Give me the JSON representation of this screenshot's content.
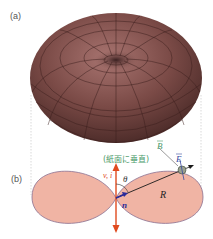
{
  "panels": {
    "a": {
      "label": "(a)",
      "description": "3D torus-shaped radiation pattern (dipole)"
    },
    "b": {
      "label": "(b)",
      "description": "2D cross-section of radiation pattern"
    }
  },
  "labels": {
    "B": "B",
    "B_note": "(紙面に垂直)",
    "E": "E",
    "v_i": "v, i",
    "theta": "θ",
    "R": "R",
    "n": "n"
  },
  "colors": {
    "torus_dark": "#4a2a28",
    "torus_mid": "#8a5a56",
    "torus_light": "#b07a74",
    "lobe_fill": "#f0b4a4",
    "lobe_stroke": "#8a6a8a",
    "arrow_red": "#e04a1e",
    "vector_n": "#2a2a9a",
    "B_color": "#4a9a6a",
    "E_color": "#3a4aa0",
    "guide_line": "#cccccc"
  }
}
